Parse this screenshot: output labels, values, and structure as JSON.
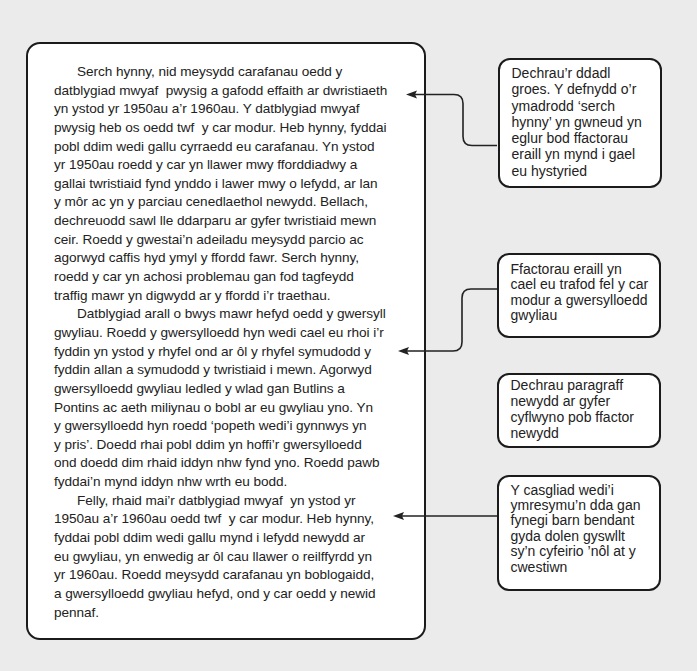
{
  "colors": {
    "background": "#ebebeb",
    "box_fill": "#ffffff",
    "box_border": "#1b1b1b",
    "text": "#222222",
    "connector": "#222222"
  },
  "essay": {
    "paragraphs": [
      {
        "lines": [
          "Serch hynny, nid meysydd carafanau oedd y",
          "datblygiad mwyaf  pwysig a gafodd effaith ar dwristiaeth",
          "yn ystod yr 1950au a’r 1960au. Y datblygiad mwyaf",
          "pwysig heb os oedd twf  y car modur. Heb hynny, fyddai",
          "pobl ddim wedi gallu cyrraedd eu carafanau. Yn ystod",
          "yr 1950au roedd y car yn llawer mwy fforddiadwy a",
          "gallai twristiaid fynd ynddo i lawer mwy o lefydd, ar lan",
          "y môr ac yn y parciau cenedlaethol newydd. Bellach,",
          "dechreuodd sawl lle ddarparu ar gyfer twristiaid mewn",
          "ceir. Roedd y gwestai’n adeiladu meysydd parcio ac",
          "agorwyd caffis hyd ymyl y ffordd fawr. Serch hynny,",
          "roedd y car yn achosi problemau gan fod tagfeydd",
          "traffig mawr yn digwydd ar y ffordd i’r traethau."
        ]
      },
      {
        "lines": [
          "Datblygiad arall o bwys mawr hefyd oedd y gwersyll",
          "gwyliau. Roedd y gwersylloedd hyn wedi cael eu rhoi i’r",
          "fyddin yn ystod y rhyfel ond ar ôl y rhyfel symudodd y",
          "fyddin allan a symudodd y twristiaid i mewn. Agorwyd",
          "gwersylloedd gwyliau ledled y wlad gan Butlins a",
          "Pontins ac aeth miliynau o bobl ar eu gwyliau yno. Yn",
          "y gwersylloedd hyn roedd ‘popeth wedi’i gynnwys yn",
          "y pris’. Doedd rhai pobl ddim yn hoffi’r gwersylloedd",
          "ond doedd dim rhaid iddyn nhw fynd yno. Roedd pawb",
          "fyddai’n mynd iddyn nhw wrth eu bodd."
        ]
      },
      {
        "lines": [
          "Felly, rhaid mai’r datblygiad mwyaf  yn ystod yr",
          "1950au a’r 1960au oedd twf  y car modur. Heb hynny,",
          "fyddai pobl ddim wedi gallu mynd i lefydd newydd ar",
          "eu gwyliau, yn enwedig ar ôl cau llawer o reilffyrdd yn",
          "yr 1960au. Roedd meysydd carafanau yn boblogaidd,",
          "a gwersylloedd gwyliau hefyd, ond y car oedd y newid",
          "pennaf."
        ]
      }
    ]
  },
  "callouts": [
    {
      "lines": [
        "Dechrau’r ddadl",
        "groes. Y defnydd o’r",
        "ymadrodd ‘serch",
        "hynny’ yn gwneud yn",
        "eglur bod ffactorau",
        "eraill yn mynd i gael",
        "eu hystyried"
      ]
    },
    {
      "lines": [
        "Ffactorau eraill yn",
        "cael eu trafod fel y car",
        "modur a gwersylloedd",
        "gwyliau"
      ]
    },
    {
      "lines": [
        "Dechrau paragraff",
        "newydd ar gyfer",
        "cyflwyno pob ffactor",
        "newydd"
      ]
    },
    {
      "lines": [
        "Y casgliad wedi’i",
        "ymresymu’n dda gan",
        "fynegi barn bendant",
        "gyda dolen gyswllt",
        "sy’n cyfeirio ’nôl at y",
        "cwestiwn"
      ]
    }
  ]
}
